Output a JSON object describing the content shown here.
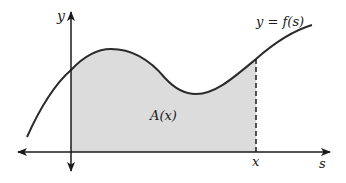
{
  "figure": {
    "labels": {
      "y_axis": "y",
      "s_axis": "s",
      "curve": "y = f(s)",
      "area": "A(x)",
      "x_marker": "x"
    },
    "colors": {
      "stroke": "#2b2b2b",
      "fill": "#dcdcdc",
      "background": "#ffffff"
    },
    "elements": {
      "y_axis": {
        "x": 71,
        "y_top": 12,
        "y_bottom": 171,
        "arrows": "both"
      },
      "s_axis": {
        "y": 152,
        "x_left": 18,
        "x_right": 330,
        "arrows": "both"
      },
      "dashed_line": {
        "x": 256,
        "y_top": 59,
        "y_bottom": 152
      },
      "shaded_region": {
        "from_s": "y-axis",
        "to_s": "x"
      }
    }
  }
}
